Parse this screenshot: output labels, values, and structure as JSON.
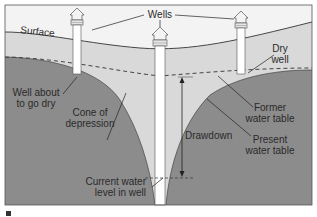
{
  "diagram": {
    "colors": {
      "sky": "#f3f3f3",
      "unsaturated": "#d9d9d9",
      "saturated": "#8c8c8c",
      "well": "#ffffff",
      "line": "#333333",
      "frame": "#555555"
    },
    "labels": {
      "surface": "Surface",
      "wells": "Wells",
      "dry_well_1": "Dry",
      "dry_well_2": "well",
      "well_dry_1": "Well about",
      "well_dry_2": "to go dry",
      "cone_1": "Cone of",
      "cone_2": "depression",
      "drawdown": "Drawdown",
      "former_1": "Former",
      "former_2": "water table",
      "present_1": "Present",
      "present_2": "water table",
      "current_1": "Current water",
      "current_2": "level in well"
    },
    "wells": [
      {
        "name": "well-about-to-go-dry",
        "x": 77
      },
      {
        "name": "pumping-well",
        "x": 160
      },
      {
        "name": "dry-well",
        "x": 241
      }
    ]
  }
}
